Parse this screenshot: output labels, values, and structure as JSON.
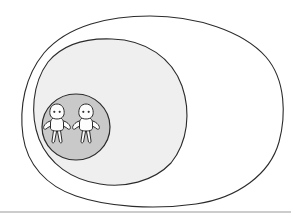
{
  "page": {
    "background_color": "#ffffff",
    "width": 291,
    "height": 222
  },
  "diagram": {
    "type": "nested-enclosure",
    "style": "hand-drawn line art",
    "description": "Three nested closed curves; two human figures inside the innermost circle",
    "stroke_color": "#2b2b2b",
    "layers": [
      {
        "name": "outer-boundary",
        "label": "outer-egg-shape",
        "fill_color": "#ffffff",
        "stroke_color": "#2b2b2b",
        "stroke_width": 1.1,
        "bounds": {
          "x": 22,
          "y": 16,
          "width": 261,
          "height": 190
        }
      },
      {
        "name": "middle-boundary",
        "label": "middle-oval-shape",
        "fill_color": "#efefef",
        "stroke_color": "#2b2b2b",
        "stroke_width": 1.1,
        "bounds": {
          "x": 33,
          "y": 39,
          "width": 155,
          "height": 146
        }
      },
      {
        "name": "inner-boundary",
        "label": "inner-gray-circle",
        "fill_color": "#c9c9c9",
        "stroke_color": "#2b2b2b",
        "stroke_width": 1.2,
        "bounds": {
          "x": 42,
          "y": 94,
          "width": 68,
          "height": 66
        }
      }
    ],
    "figures": [
      {
        "name": "person-left",
        "body_fill": "#fdfdfd",
        "stroke_color": "#2b2b2b",
        "eye_color": "#333333",
        "center_x": 57,
        "center_y": 124,
        "eye_count": 2
      },
      {
        "name": "person-right",
        "body_fill": "#fdfdfd",
        "stroke_color": "#2b2b2b",
        "eye_color": "#333333",
        "center_x": 86,
        "center_y": 124,
        "eye_count": 2
      }
    ],
    "divider": {
      "name": "bottom-divider-line",
      "color": "#9a9a9a",
      "y": 212,
      "x_start": 0,
      "x_end": 291,
      "thickness": 1.2
    }
  }
}
